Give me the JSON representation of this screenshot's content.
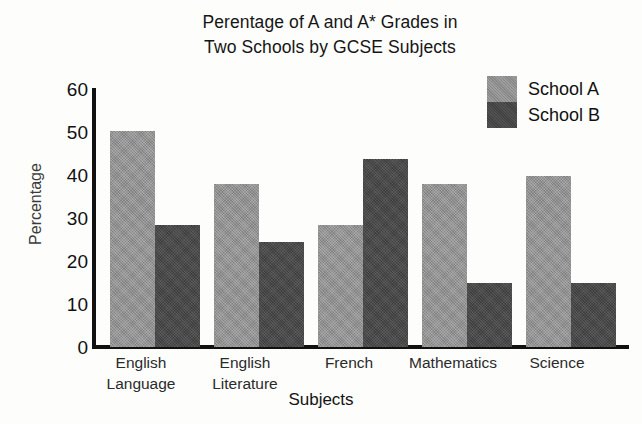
{
  "chart_data": {
    "type": "bar",
    "title": "Perentage of A and A* Grades in Two Schools by GCSE Subjects",
    "title_lines": [
      "Perentage of A and A* Grades in",
      "Two Schools by GCSE Subjects"
    ],
    "xlabel": "Subjects",
    "ylabel": "Percentage",
    "ylim": [
      0,
      60
    ],
    "yticks": [
      0,
      10,
      20,
      30,
      40,
      50,
      60
    ],
    "ytick_labels": [
      "0",
      "10",
      "20",
      "30",
      "40",
      "50",
      "60"
    ],
    "grid": false,
    "legend_position": "top-right",
    "categories": [
      "English Language",
      "English Literature",
      "French",
      "Mathematics",
      "Science"
    ],
    "category_lines": [
      [
        "English",
        "Language"
      ],
      [
        "English",
        "Literature"
      ],
      [
        "French",
        ""
      ],
      [
        "Mathematics",
        ""
      ],
      [
        "Science",
        ""
      ]
    ],
    "series": [
      {
        "name": "School A",
        "color": "#8e8e8e",
        "values": [
          50.5,
          38,
          28.5,
          38,
          40
        ]
      },
      {
        "name": "School B",
        "color": "#454545",
        "values": [
          28.5,
          24.5,
          44,
          15,
          15
        ]
      }
    ]
  },
  "legend": {
    "items": [
      {
        "label": "School A",
        "series": "a"
      },
      {
        "label": "School B",
        "series": "b"
      }
    ]
  }
}
